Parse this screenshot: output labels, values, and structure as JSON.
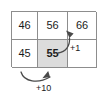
{
  "figure": {
    "title": "",
    "type": "annotated-grid"
  },
  "grid": {
    "rows": [
      {
        "cells": [
          {
            "value": "46",
            "shaded": false,
            "bold": false
          },
          {
            "value": "56",
            "shaded": false,
            "bold": false
          },
          {
            "value": "66",
            "shaded": false,
            "bold": false
          }
        ]
      },
      {
        "cells": [
          {
            "value": "45",
            "shaded": false,
            "bold": false
          },
          {
            "value": "55",
            "shaded": true,
            "bold": true
          },
          {
            "value": "",
            "shaded": false,
            "bold": false
          }
        ]
      }
    ],
    "border_color": "#8d8d8d",
    "shade_color": "#dcdcdc",
    "text_color": "#1b1b1b"
  },
  "annotations": [
    {
      "id": "plus-one",
      "label": "+1",
      "from_cell": "55",
      "to_cell": "56",
      "direction": "up",
      "arrow_color": "#4a4a4a"
    },
    {
      "id": "plus-ten",
      "label": "+10",
      "from_cell": "45",
      "to_cell": "55",
      "direction": "right",
      "arrow_color": "#4a4a4a"
    }
  ]
}
